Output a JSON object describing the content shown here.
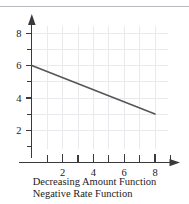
{
  "figure": {
    "caption_line1": "Decreasing Amount Function",
    "caption_line2": "Negative Rate Function"
  },
  "colors": {
    "line": "#565659",
    "axis": "#3a3a3d",
    "grid": "#e9e9ee",
    "text": "#1b1b1b",
    "rule": "#b9b9bf",
    "background": "#ffffff"
  },
  "chart_data": {
    "type": "line",
    "title": "",
    "subtitle": "",
    "xlabel": "",
    "ylabel": "",
    "xlim": [
      0,
      9.2
    ],
    "ylim": [
      0,
      9.0
    ],
    "grid": true,
    "legend": "none",
    "x_ticks_major": [
      2,
      4,
      6,
      8
    ],
    "x_ticks_minor": [
      1,
      3,
      5,
      7,
      9
    ],
    "x_tick_labels": [
      "2",
      "4",
      "6",
      "8"
    ],
    "y_ticks_major": [
      2,
      4,
      6,
      8
    ],
    "y_ticks_minor": [
      1,
      3,
      5,
      7
    ],
    "y_tick_labels": [
      "2",
      "4",
      "6",
      "8"
    ],
    "x_axis_arrow": true,
    "y_axis_arrow": true,
    "series": [
      {
        "name": "Decreasing amount function",
        "x": [
          0,
          8
        ],
        "values": [
          6,
          3
        ],
        "slope": -0.375,
        "intercept": 6
      }
    ],
    "annotations": [
      "Decreasing Amount Function",
      "Negative Rate Function"
    ]
  }
}
